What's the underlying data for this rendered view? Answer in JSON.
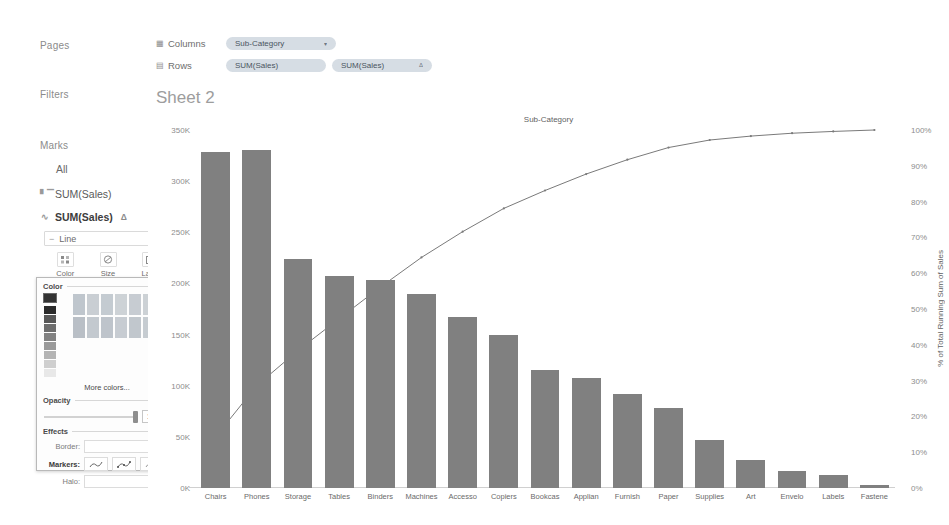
{
  "shelves": {
    "pages_label": "Pages",
    "filters_label": "Filters",
    "marks_label": "Marks",
    "marks_all": "All",
    "mark_card_1": "SUM(Sales)",
    "mark_card_2": "SUM(Sales)",
    "mark_card_2_delta": "Δ",
    "mark_type": "Line",
    "bar_icon": "bar-chart-icon",
    "line_icon": "line-chart-icon",
    "caret": "▾",
    "buttons": [
      {
        "label": "Color",
        "icon": "color-palette-icon",
        "glyph": "⁙"
      },
      {
        "label": "Size",
        "icon": "size-icon",
        "glyph": "◔"
      },
      {
        "label": "Label",
        "icon": "label-icon",
        "glyph": "▣"
      }
    ]
  },
  "color_popup": {
    "color_section": "Color",
    "more_colors": "More colors...",
    "opacity_section": "Opacity",
    "opacity_value": "100%",
    "effects_section": "Effects",
    "border_label": "Border:",
    "markers_label": "Markers:",
    "halo_label": "Halo:",
    "selected_swatch": "#333333",
    "grays": [
      "#2b2b2b",
      "#585858",
      "#6e6e6e",
      "#828282",
      "#9a9a9a",
      "#b4b4b4",
      "#cfcfcf",
      "#e8e8e8"
    ],
    "grid_colors": [
      [
        "#bfc6cd",
        "#c9ced3",
        "#c4cbd1",
        "#cdd2d6",
        "#c7ccd2",
        "#ccd1d5"
      ],
      [
        "#b9bfc6",
        "#c3c9cf",
        "#bec4cb",
        "#c7ccd2",
        "#c1c7cd",
        "#c6ccd1"
      ]
    ],
    "marker_glyphs": [
      "∿",
      "⌇",
      "∿"
    ]
  },
  "columns_shelf": {
    "icon": "columns-grid-icon",
    "name": "Columns",
    "pills": [
      {
        "label": "Sub-Category",
        "caret": "▾"
      }
    ]
  },
  "rows_shelf": {
    "icon": "rows-grid-icon",
    "name": "Rows",
    "pills": [
      {
        "label": "SUM(Sales)",
        "caret": ""
      },
      {
        "label": "SUM(Sales)",
        "caret": "Δ"
      }
    ]
  },
  "sheet": {
    "title": "Sheet 2"
  },
  "chart_data": {
    "type": "bar",
    "title": "Sheet 2",
    "column_header": "Sub-Category",
    "xlabel": "Sub-Category",
    "ylabel": "",
    "y2label": "% of Total Running Sum of Sales",
    "ylim": [
      0,
      350000
    ],
    "y2lim": [
      0,
      1
    ],
    "grid": false,
    "legend": "none",
    "ytick_labels": [
      "350K",
      "300K",
      "250K",
      "200K",
      "150K",
      "100K",
      "50K",
      "0K"
    ],
    "ytick_values": [
      350000,
      300000,
      250000,
      200000,
      150000,
      100000,
      50000,
      0
    ],
    "y2tick_labels": [
      "100%",
      "90%",
      "80%",
      "70%",
      "60%",
      "50%",
      "40%",
      "30%",
      "20%",
      "10%",
      "0%"
    ],
    "y2tick_values": [
      100,
      90,
      80,
      70,
      60,
      50,
      40,
      30,
      20,
      10,
      0
    ],
    "categories": [
      "Chairs",
      "Phones",
      "Storage",
      "Tables",
      "Binders",
      "Machines",
      "Accesso",
      "Copiers",
      "Bookcas",
      "Applian",
      "Furnish",
      "Paper",
      "Supplies",
      "Art",
      "Envelo",
      "Labels",
      "Fastene"
    ],
    "series": [
      {
        "name": "SUM(Sales)",
        "type": "bar",
        "color": "#808080",
        "values": [
          328450,
          330000,
          223800,
          206950,
          203400,
          189200,
          167400,
          149500,
          114900,
          107500,
          91700,
          78450,
          46700,
          27100,
          16450,
          12350,
          3000
        ]
      },
      {
        "name": "% of Total Running Sum of Sales",
        "type": "line",
        "color": "#7a7a7a",
        "axis": "right",
        "values": [
          14.3,
          28.6,
          38.4,
          47.3,
          56.1,
          64.4,
          71.6,
          78.1,
          83.1,
          87.7,
          91.7,
          95.1,
          97.2,
          98.3,
          99.1,
          99.6,
          100.0
        ]
      }
    ]
  }
}
